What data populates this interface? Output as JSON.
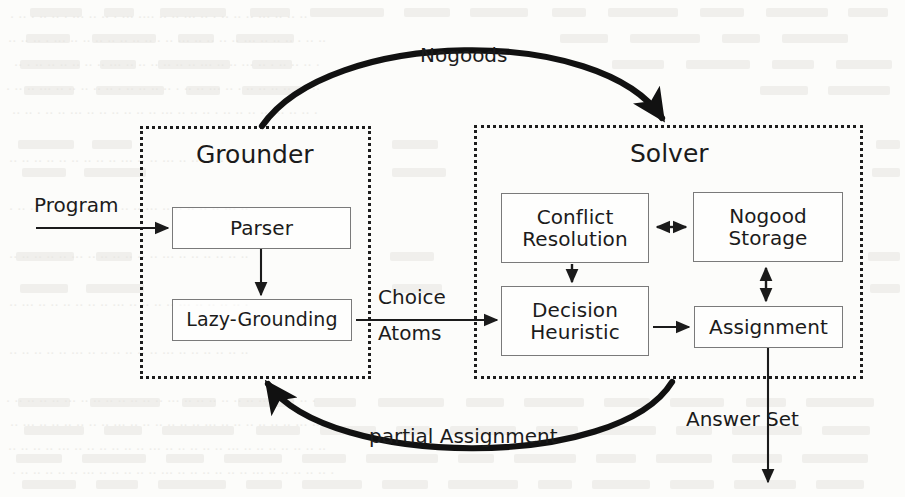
{
  "figure": {
    "background_color": "#fcfcfa",
    "ink_color": "#1b1b1b",
    "box_border_color": "#7a7a7a",
    "group_border_color": "#1d1d1d"
  },
  "groups": [
    {
      "id": "grounder",
      "label": "Grounder"
    },
    {
      "id": "solver",
      "label": "Solver"
    }
  ],
  "nodes": [
    {
      "id": "parser",
      "lines": [
        "Parser"
      ]
    },
    {
      "id": "lazy-grounding",
      "lines": [
        "Lazy-Grounding"
      ]
    },
    {
      "id": "conflict-resolution",
      "lines": [
        "Conflict",
        "Resolution"
      ]
    },
    {
      "id": "nogood-storage",
      "lines": [
        "Nogood",
        "Storage"
      ]
    },
    {
      "id": "decision-heuristic",
      "lines": [
        "Decision",
        "Heuristic"
      ]
    },
    {
      "id": "assignment",
      "lines": [
        "Assignment"
      ]
    }
  ],
  "edge_labels": {
    "program": "Program",
    "nogoods": "Nogoods",
    "choice_atoms_line1": "Choice",
    "choice_atoms_line2": "Atoms",
    "partial_assignment": "partial Assignment",
    "answer_set": "Answer Set"
  }
}
